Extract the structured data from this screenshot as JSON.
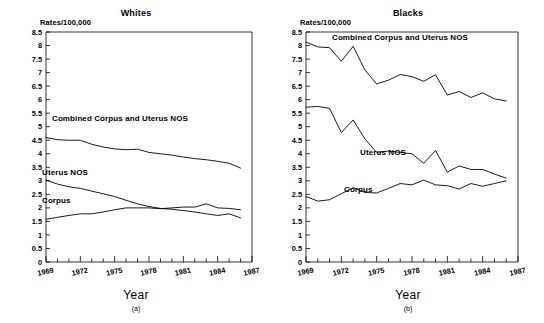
{
  "figure": {
    "axis_title": "Year",
    "y_units_label": "Rates/100,000"
  },
  "panels": [
    {
      "key": "whites",
      "title": "Whites",
      "subcaption": "(a)",
      "series_labels": {
        "combined": "Combined Corpus and Uterus NOS",
        "uterus": "Uterus NOS",
        "corpus": "Corpus"
      }
    },
    {
      "key": "blacks",
      "title": "Blacks",
      "subcaption": "(b)",
      "series_labels": {
        "combined": "Combined Corpus and Uterus NOS",
        "uterus": "Uterus NOS",
        "corpus": "Corpus"
      }
    }
  ],
  "chart_data": [
    {
      "type": "line",
      "title": "Whites",
      "subcaption": "(a)",
      "xlabel": "Year",
      "ylabel": "Rates/100,000",
      "xlim": [
        1969,
        1987
      ],
      "ylim": [
        0,
        8.5
      ],
      "ytick_step": 0.5,
      "yticks": [
        0,
        0.5,
        1,
        1.5,
        2,
        2.5,
        3,
        3.5,
        4,
        4.5,
        5,
        5.5,
        6,
        6.5,
        7,
        7.5,
        8,
        8.5
      ],
      "ytick_labels": [
        "0",
        "0.5",
        "1",
        "1.5",
        "2",
        "2.5",
        "3",
        "3.5",
        "4",
        "4.5",
        "5",
        "5.5",
        "6",
        "6.5",
        "7",
        "7.5",
        "8",
        "8.5"
      ],
      "xticks_major": [
        1969,
        1972,
        1975,
        1978,
        1981,
        1984,
        1987
      ],
      "xtick_labels": [
        "1969",
        "1972",
        "1975",
        "1978",
        "1981",
        "1984",
        "1987"
      ],
      "xticks_minor_step": 1,
      "grid": false,
      "legend": "inline-labels",
      "x": [
        1969,
        1970,
        1971,
        1972,
        1973,
        1974,
        1975,
        1976,
        1977,
        1978,
        1979,
        1980,
        1981,
        1982,
        1983,
        1984,
        1985,
        1986
      ],
      "series": [
        {
          "name": "Combined Corpus and Uterus NOS",
          "values": [
            4.6,
            4.52,
            4.5,
            4.5,
            4.35,
            4.25,
            4.18,
            4.15,
            4.17,
            4.05,
            4.0,
            3.95,
            3.88,
            3.82,
            3.78,
            3.72,
            3.65,
            3.47
          ]
        },
        {
          "name": "Uterus NOS",
          "values": [
            3.03,
            2.88,
            2.78,
            2.72,
            2.62,
            2.52,
            2.42,
            2.28,
            2.15,
            2.05,
            1.98,
            1.95,
            1.9,
            1.85,
            1.78,
            1.72,
            1.78,
            1.63
          ]
        },
        {
          "name": "Corpus",
          "values": [
            1.58,
            1.65,
            1.72,
            1.78,
            1.78,
            1.85,
            1.93,
            2.0,
            2.0,
            2.0,
            1.97,
            2.0,
            2.03,
            2.03,
            2.15,
            2.0,
            1.98,
            1.93
          ]
        }
      ]
    },
    {
      "type": "line",
      "title": "Blacks",
      "subcaption": "(b)",
      "xlabel": "Year",
      "ylabel": "Rates/100,000",
      "xlim": [
        1969,
        1987
      ],
      "ylim": [
        0,
        8.5
      ],
      "ytick_step": 0.5,
      "yticks": [
        0,
        0.5,
        1,
        1.5,
        2,
        2.5,
        3,
        3.5,
        4,
        4.5,
        5,
        5.5,
        6,
        6.5,
        7,
        7.5,
        8,
        8.5
      ],
      "ytick_labels": [
        "0",
        "0.5",
        "1",
        "1.5",
        "2",
        "2.5",
        "3",
        "3.5",
        "4",
        "4.5",
        "5",
        "5.5",
        "6",
        "6.5",
        "7",
        "7.5",
        "8",
        "8.5"
      ],
      "xticks_major": [
        1969,
        1972,
        1975,
        1978,
        1981,
        1984,
        1987
      ],
      "xtick_labels": [
        "1969",
        "1972",
        "1975",
        "1978",
        "1981",
        "1984",
        "1987"
      ],
      "xticks_minor_step": 1,
      "grid": false,
      "legend": "inline-labels",
      "x": [
        1969,
        1970,
        1971,
        1972,
        1973,
        1974,
        1975,
        1976,
        1977,
        1978,
        1979,
        1980,
        1981,
        1982,
        1983,
        1984,
        1985,
        1986
      ],
      "series": [
        {
          "name": "Combined Corpus and Uterus NOS",
          "values": [
            8.13,
            7.95,
            7.92,
            7.42,
            7.97,
            7.1,
            6.58,
            6.72,
            6.93,
            6.85,
            6.68,
            6.92,
            6.17,
            6.3,
            6.08,
            6.25,
            6.03,
            5.95
          ]
        },
        {
          "name": "Uterus NOS",
          "values": [
            5.72,
            5.75,
            5.68,
            4.78,
            5.25,
            4.55,
            4.05,
            4.1,
            4.05,
            4.0,
            3.65,
            4.12,
            3.32,
            3.55,
            3.42,
            3.42,
            3.25,
            3.1
          ]
        },
        {
          "name": "Corpus",
          "values": [
            2.42,
            2.25,
            2.3,
            2.52,
            2.75,
            2.57,
            2.55,
            2.72,
            2.9,
            2.85,
            3.03,
            2.85,
            2.82,
            2.7,
            2.9,
            2.8,
            2.9,
            3.0
          ]
        }
      ]
    }
  ]
}
